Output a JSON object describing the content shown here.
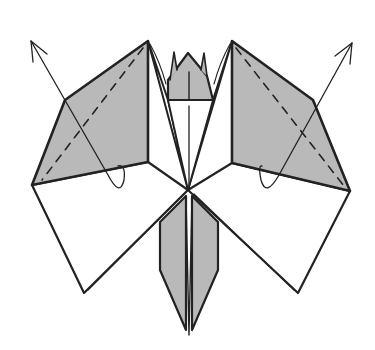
{
  "diagram": {
    "title": "Origami folding step",
    "colors": {
      "shade": "#b9b9b9",
      "line": "#222222",
      "paper": "#ffffff"
    },
    "elements": [
      {
        "id": "left-upper-flap",
        "type": "shaded-flap"
      },
      {
        "id": "right-upper-flap",
        "type": "shaded-flap"
      },
      {
        "id": "left-valley-fold",
        "type": "dashed-line"
      },
      {
        "id": "right-valley-fold",
        "type": "dashed-line"
      },
      {
        "id": "left-fold-arrow",
        "type": "arrow"
      },
      {
        "id": "right-fold-arrow",
        "type": "arrow"
      },
      {
        "id": "head-flap",
        "type": "shaded-flap"
      },
      {
        "id": "lower-left-flap",
        "type": "white-flap"
      },
      {
        "id": "lower-right-flap",
        "type": "white-flap"
      },
      {
        "id": "tail-left",
        "type": "shaded-flap"
      },
      {
        "id": "tail-right",
        "type": "shaded-flap"
      }
    ]
  }
}
